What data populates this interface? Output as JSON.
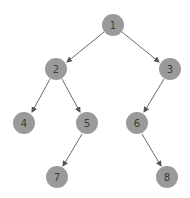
{
  "diagram": {
    "type": "binary-tree",
    "colors": {
      "node_fill": "#9a9a9a",
      "label": "#3a3a3a",
      "edge": "#6a6a6a",
      "background": "#ffffff"
    },
    "nodes": [
      {
        "id": "1",
        "label": "1",
        "x": 113,
        "y": 25
      },
      {
        "id": "2",
        "label": "2",
        "x": 56,
        "y": 69
      },
      {
        "id": "3",
        "label": "3",
        "x": 170,
        "y": 69
      },
      {
        "id": "4",
        "label": "4",
        "x": 24,
        "y": 123
      },
      {
        "id": "5",
        "label": "5",
        "x": 87,
        "y": 123
      },
      {
        "id": "6",
        "label": "6",
        "x": 137,
        "y": 123
      },
      {
        "id": "7",
        "label": "7",
        "x": 57,
        "y": 177
      },
      {
        "id": "8",
        "label": "8",
        "x": 167,
        "y": 177
      }
    ],
    "edges": [
      {
        "from": "1",
        "to": "2"
      },
      {
        "from": "1",
        "to": "3"
      },
      {
        "from": "2",
        "to": "4"
      },
      {
        "from": "2",
        "to": "5"
      },
      {
        "from": "3",
        "to": "6"
      },
      {
        "from": "5",
        "to": "7"
      },
      {
        "from": "6",
        "to": "8"
      }
    ]
  }
}
